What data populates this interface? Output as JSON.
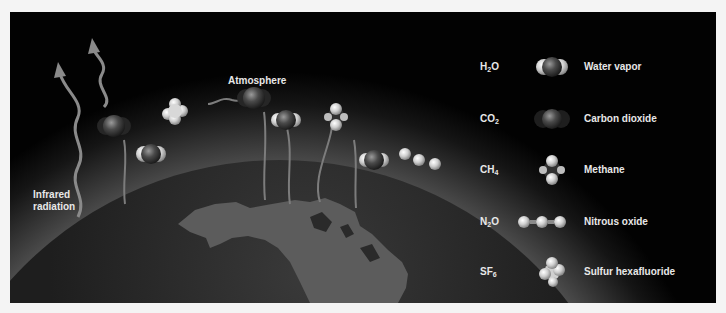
{
  "diagram": {
    "title_label": "Atmosphere",
    "radiation_label_line1": "Infrared",
    "radiation_label_line2": "radiation",
    "colors": {
      "background": "#020202",
      "frame": "#f4f4f4",
      "atmosphere_glow": "#6e6e6e",
      "earth": "#2a2a2a",
      "land": "#5a5a5a",
      "arrow": "#8a8a8a",
      "text": "#e8e8e8"
    }
  },
  "legend": {
    "items": [
      {
        "formula_base": "H",
        "formula_sub": "2",
        "formula_tail": "O",
        "name": "Water vapor",
        "icon": "water-molecule"
      },
      {
        "formula_base": "CO",
        "formula_sub": "2",
        "formula_tail": "",
        "name": "Carbon dioxide",
        "icon": "co2-molecule"
      },
      {
        "formula_base": "CH",
        "formula_sub": "4",
        "formula_tail": "",
        "name": "Methane",
        "icon": "methane-molecule"
      },
      {
        "formula_base": "N",
        "formula_sub": "2",
        "formula_tail": "O",
        "name": "Nitrous oxide",
        "icon": "n2o-molecule"
      },
      {
        "formula_base": "SF",
        "formula_sub": "6",
        "formula_tail": "",
        "name": "Sulfur hexafluoride",
        "icon": "sf6-molecule"
      }
    ]
  }
}
